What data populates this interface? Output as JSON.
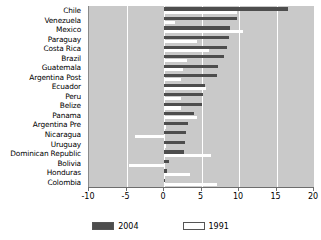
{
  "chart_data": {
    "type": "bar",
    "orientation": "horizontal",
    "title": "",
    "subtitle": "",
    "xlabel": "",
    "ylabel": "",
    "xlim": [
      -10,
      20
    ],
    "xticks": [
      -10,
      -5,
      0,
      5,
      10,
      15,
      20
    ],
    "xticklabels": [
      "-10",
      "-5",
      "0",
      "5",
      "10",
      "15",
      "20"
    ],
    "grid": true,
    "grid_axis": "x",
    "legend_position": "bottom",
    "plot_background": "#c9c9c9",
    "categories": [
      "Chile",
      "Venezuela",
      "Mexico",
      "Paraguay",
      "Costa Rica",
      "Brazil",
      "Guatemala",
      "Argentina Post",
      "Ecuador",
      "Peru",
      "Belize",
      "Panama",
      "Argentina Pre",
      "Nicaragua",
      "Uruguay",
      "Dominican Republic",
      "Bolivia",
      "Honduras",
      "Colombia"
    ],
    "series": [
      {
        "name": "2004",
        "color": "#4d4d4d",
        "values": [
          16.5,
          9.7,
          8.8,
          8.6,
          8.4,
          8.0,
          7.2,
          7.0,
          5.4,
          5.2,
          5.0,
          4.0,
          3.2,
          2.9,
          2.8,
          2.6,
          0.6,
          0.4,
          0.1
        ]
      },
      {
        "name": "1991",
        "color": "#ffffff",
        "values": [
          9.7,
          1.4,
          10.5,
          4.4,
          6.0,
          3.0,
          2.5,
          2.3,
          5.6,
          2.3,
          2.3,
          4.4,
          0.3,
          -3.9,
          0.2,
          6.2,
          -4.7,
          3.5,
          7.0
        ]
      }
    ]
  },
  "legend": {
    "items": [
      {
        "label": "2004",
        "swatch": "dark-filled-swatch"
      },
      {
        "label": "1991",
        "swatch": "white-outlined-swatch"
      }
    ]
  }
}
